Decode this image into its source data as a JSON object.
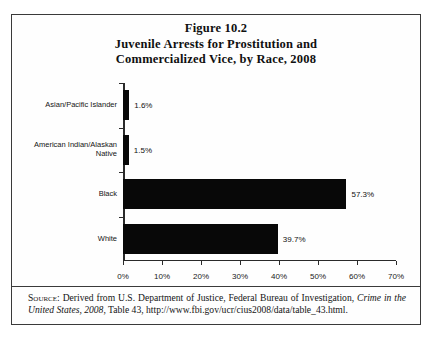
{
  "figure": {
    "title_lines": [
      "Figure 10.2",
      "Juvenile Arrests for Prostitution and",
      "Commercialized Vice, by Race, 2008"
    ],
    "source_label": "Source:",
    "source_text_1": " Derived from U.S. Department of Justice, Federal Bureau of Investigation, ",
    "source_italic_1": "Crime in the United States, 2008",
    "source_text_2": ", Table 43, http://www.fbi.gov/ucr/cius2008/data/table_43.html."
  },
  "chart_data": {
    "type": "bar",
    "orientation": "horizontal",
    "categories": [
      "Asian/Pacific Islander",
      "American Indian/Alaskan Native",
      "Black",
      "White"
    ],
    "values": [
      1.6,
      1.5,
      57.3,
      39.7
    ],
    "value_labels": [
      "1.6%",
      "1.5%",
      "57.3%",
      "39.7%"
    ],
    "xlabel": "",
    "ylabel": "",
    "xlim": [
      0,
      70
    ],
    "xticks": [
      0,
      10,
      20,
      30,
      40,
      50,
      60,
      70
    ],
    "xtick_labels": [
      "0%",
      "10%",
      "20%",
      "30%",
      "40%",
      "50%",
      "60%",
      "70%"
    ],
    "grid": false,
    "legend": false,
    "bar_color": "#080808"
  }
}
